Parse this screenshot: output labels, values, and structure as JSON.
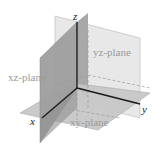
{
  "diagram": {
    "axes": {
      "x_label": "x",
      "y_label": "y",
      "z_label": "z"
    },
    "planes": [
      {
        "name": "xz-plane",
        "label": "xz-plane",
        "fill": "#9e9e9e"
      },
      {
        "name": "yz-plane",
        "label": "yz-plane",
        "fill": "#e6e6e6"
      },
      {
        "name": "xy-plane",
        "label": "xy-plane",
        "fill": "#c4c4c4"
      }
    ],
    "colors": {
      "axis": "#1a1a1a",
      "dashed": "#9a9a9a",
      "label_muted": "#9a9a9a"
    }
  }
}
